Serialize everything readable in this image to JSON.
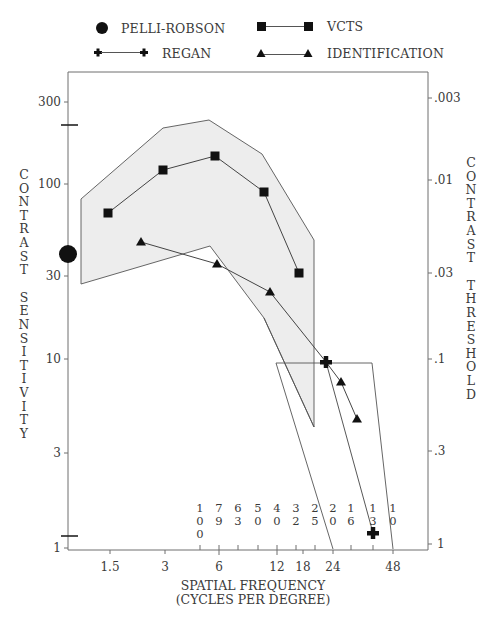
{
  "chart_data": {
    "type": "line",
    "title": "",
    "xlabel": "SPATIAL FREQUENCY (CYCLES PER DEGREE)",
    "xlabel_lines": [
      "SPATIAL FREQUENCY",
      "(CYCLES PER DEGREE)"
    ],
    "ylabel": "CONTRAST SENSITIVITY",
    "ylabel_right": "CONTRAST THRESHOLD",
    "x_scale": "log",
    "y_scale": "log",
    "xlim": [
      1.0,
      70
    ],
    "ylim": [
      1,
      400
    ],
    "x_ticks": [
      "1.5",
      "3",
      "6",
      "12",
      "18",
      "24",
      "48"
    ],
    "y_ticks_left": [
      "1",
      "3",
      "10",
      "30",
      "100",
      "300"
    ],
    "y_ticks_right": [
      "1",
      ".3",
      ".1",
      ".03",
      ".01",
      ".003"
    ],
    "snellen_labels": [
      "100",
      "79",
      "63",
      "50",
      "40",
      "32",
      "25",
      "20",
      "16",
      "13",
      "10"
    ],
    "grid": false,
    "legend_position": "top",
    "legend": [
      {
        "name": "PELLI-ROBSON",
        "marker": "circle"
      },
      {
        "name": "VCTS",
        "marker": "square"
      },
      {
        "name": "REGAN",
        "marker": "cross"
      },
      {
        "name": "IDENTIFICATION",
        "marker": "triangle"
      }
    ],
    "series": [
      {
        "name": "VCTS",
        "marker": "square",
        "x": [
          1.5,
          3,
          6,
          12,
          18
        ],
        "y": [
          70,
          120,
          145,
          90,
          31
        ]
      },
      {
        "name": "IDENTIFICATION",
        "marker": "triangle",
        "x": [
          2.2,
          6,
          11,
          24,
          28,
          33
        ],
        "y": [
          45,
          36,
          25,
          10,
          7.8,
          5.0
        ]
      },
      {
        "name": "REGAN",
        "marker": "cross",
        "x": [
          24,
          40
        ],
        "y": [
          10,
          1.2
        ]
      },
      {
        "name": "PELLI-ROBSON",
        "marker": "circle",
        "x": [
          1.0
        ],
        "y": [
          42
        ]
      }
    ],
    "annotations": [
      {
        "type": "shaded_region",
        "description": "VCTS normal range (gray band)"
      },
      {
        "type": "outline_region",
        "description": "Regan normal range (trapezoid)"
      },
      {
        "type": "axis_marks",
        "description": "Pelli-Robson range marks on left axis at ~200 and ~1.2"
      }
    ]
  },
  "legend": {
    "pelli": "PELLI-ROBSON",
    "vcts": "VCTS",
    "regan": "REGAN",
    "ident": "IDENTIFICATION"
  },
  "axes": {
    "left_ticks": [
      {
        "label": "300",
        "y": 102
      },
      {
        "label": "100",
        "y": 184
      },
      {
        "label": "30",
        "y": 276
      },
      {
        "label": "10",
        "y": 359
      },
      {
        "label": "3",
        "y": 453
      },
      {
        "label": "1",
        "y": 548
      }
    ],
    "right_ticks": [
      {
        "label": ".003",
        "y": 98
      },
      {
        "label": ".01",
        "y": 180
      },
      {
        "label": ".03",
        "y": 273
      },
      {
        "label": ".1",
        "y": 359
      },
      {
        "label": ".3",
        "y": 451
      },
      {
        "label": "1",
        "y": 544
      }
    ],
    "bottom_ticks": [
      {
        "label": "1.5",
        "x": 110
      },
      {
        "label": "3",
        "x": 165
      },
      {
        "label": "6",
        "x": 219
      },
      {
        "label": "12",
        "x": 277
      },
      {
        "label": "18",
        "x": 303
      },
      {
        "label": "24",
        "x": 333
      },
      {
        "label": "48",
        "x": 393
      }
    ],
    "left_title": "CONTRAST SENSITIVITY",
    "right_title": "CONTRAST THRESHOLD",
    "bottom_title_1": "SPATIAL FREQUENCY",
    "bottom_title_2": "(CYCLES PER DEGREE)"
  },
  "snellen": [
    {
      "digits": [
        "1",
        "0",
        "0"
      ],
      "x": 200
    },
    {
      "digits": [
        "7",
        "9"
      ],
      "x": 219
    },
    {
      "digits": [
        "6",
        "3"
      ],
      "x": 238
    },
    {
      "digits": [
        "5",
        "0"
      ],
      "x": 258
    },
    {
      "digits": [
        "4",
        "0"
      ],
      "x": 277
    },
    {
      "digits": [
        "3",
        "2"
      ],
      "x": 296
    },
    {
      "digits": [
        "2",
        "5"
      ],
      "x": 315
    },
    {
      "digits": [
        "2",
        "0"
      ],
      "x": 333
    },
    {
      "digits": [
        "1",
        "6"
      ],
      "x": 351
    },
    {
      "digits": [
        "1",
        "3"
      ],
      "x": 373
    },
    {
      "digits": [
        "1",
        "0"
      ],
      "x": 393
    }
  ],
  "colors": {
    "axis": "#6e6e6e",
    "line": "#555555",
    "marker": "#111111",
    "band_fill": "#ededed",
    "text": "#3a3a3a"
  }
}
